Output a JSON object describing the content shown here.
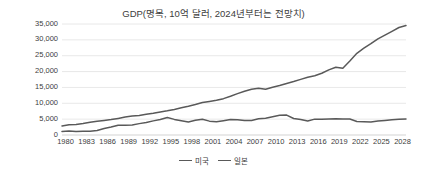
{
  "chart_data": {
    "type": "line",
    "title": "GDP(명목, 10억 달러, 2024년부터는 전망치)",
    "xlabel": "",
    "ylabel": "",
    "ylim": [
      0,
      35000
    ],
    "ytick_labels": [
      "35,000",
      "30,000",
      "25,000",
      "20,000",
      "15,000",
      "10,000",
      "5,000",
      "0"
    ],
    "ytick_values": [
      35000,
      30000,
      25000,
      20000,
      15000,
      10000,
      5000,
      0
    ],
    "grid": true,
    "legend_position": "bottom",
    "xlim": [
      1980,
      2029
    ],
    "tick_labels": [
      "1980",
      "1983",
      "1986",
      "1989",
      "1992",
      "1995",
      "1998",
      "2001",
      "2004",
      "2007",
      "2010",
      "2013",
      "2016",
      "2019",
      "2022",
      "2025",
      "2028"
    ],
    "x": [
      1980,
      1981,
      1982,
      1983,
      1984,
      1985,
      1986,
      1987,
      1988,
      1989,
      1990,
      1991,
      1992,
      1993,
      1994,
      1995,
      1996,
      1997,
      1998,
      1999,
      2000,
      2001,
      2002,
      2003,
      2004,
      2005,
      2006,
      2007,
      2008,
      2009,
      2010,
      2011,
      2012,
      2013,
      2014,
      2015,
      2016,
      2017,
      2018,
      2019,
      2020,
      2021,
      2022,
      2023,
      2024,
      2025,
      2026,
      2027,
      2028,
      2029
    ],
    "series": [
      {
        "name": "미국",
        "color": "#595959",
        "values": [
          2857,
          3207,
          3344,
          3634,
          4038,
          4339,
          4580,
          4855,
          5236,
          5642,
          5963,
          6158,
          6520,
          6859,
          7287,
          7640,
          8073,
          8578,
          9063,
          9631,
          10251,
          10582,
          10936,
          11458,
          12214,
          13037,
          13815,
          14452,
          14713,
          14449,
          15049,
          15600,
          16254,
          16843,
          17551,
          18206,
          18695,
          19477,
          20533,
          21381,
          21060,
          23315,
          25744,
          27361,
          28783,
          30337,
          31500,
          32700,
          33900,
          34500
        ]
      },
      {
        "name": "일본",
        "color": "#595959",
        "values": [
          1128,
          1247,
          1134,
          1213,
          1200,
          1399,
          2053,
          2507,
          3072,
          3055,
          3186,
          3584,
          3909,
          4454,
          4907,
          5545,
          4923,
          4492,
          4098,
          4635,
          4968,
          4375,
          4183,
          4519,
          4893,
          4831,
          4601,
          4579,
          5106,
          5289,
          5759,
          6233,
          6272,
          5212,
          4897,
          4445,
          5003,
          4931,
          5038,
          5118,
          5056,
          5034,
          4256,
          4213,
          4110,
          4386,
          4600,
          4800,
          4950,
          5060
        ]
      }
    ]
  }
}
